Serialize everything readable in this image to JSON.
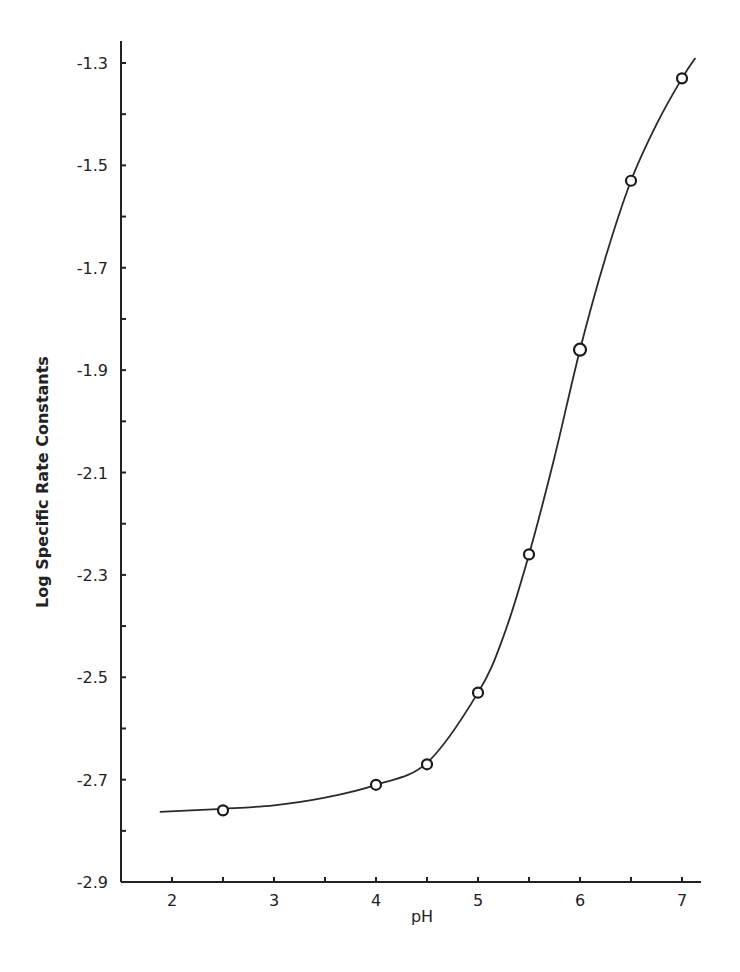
{
  "chart_data": {
    "type": "line",
    "title": "",
    "xlabel": "pH",
    "ylabel": "Log Specific Rate Constants",
    "xlim": [
      1.5,
      7.2
    ],
    "ylim": [
      -2.9,
      -1.25
    ],
    "grid": false,
    "legend": null,
    "x_ticks": [
      2,
      2.5,
      3,
      3.5,
      4,
      4.5,
      5,
      5.5,
      6,
      6.5,
      7
    ],
    "x_tick_labels": [
      "2",
      "3",
      "4",
      "5",
      "6",
      "7"
    ],
    "y_ticks": [
      -2.9,
      -2.8,
      -2.7,
      -2.6,
      -2.5,
      -2.4,
      -2.3,
      -2.2,
      -2.1,
      -2.0,
      -1.9,
      -1.8,
      -1.7,
      -1.6,
      -1.5,
      -1.4,
      -1.3
    ],
    "y_tick_labels": [
      "-1.3",
      "-1.5",
      "-1.7",
      "-1.9",
      "-2.1",
      "-2.3",
      "-2.5",
      "-2.7",
      "-2.9"
    ],
    "series": [
      {
        "name": "measured",
        "style": "open-circle-markers",
        "x": [
          2.5,
          4.0,
          4.5,
          5.0,
          5.5,
          6.0,
          6.5,
          7.0
        ],
        "y": [
          -2.76,
          -2.71,
          -2.67,
          -2.53,
          -2.26,
          -1.86,
          -1.53,
          -1.33
        ]
      },
      {
        "name": "fitted-curve",
        "style": "smooth-line",
        "x": [
          1.88,
          2.5,
          3.0,
          3.5,
          4.0,
          4.5,
          5.0,
          5.25,
          5.5,
          5.75,
          6.0,
          6.25,
          6.5,
          6.75,
          7.0,
          7.13
        ],
        "y": [
          -2.763,
          -2.757,
          -2.75,
          -2.735,
          -2.71,
          -2.667,
          -2.53,
          -2.42,
          -2.26,
          -2.07,
          -1.86,
          -1.68,
          -1.53,
          -1.42,
          -1.33,
          -1.29
        ]
      }
    ]
  }
}
